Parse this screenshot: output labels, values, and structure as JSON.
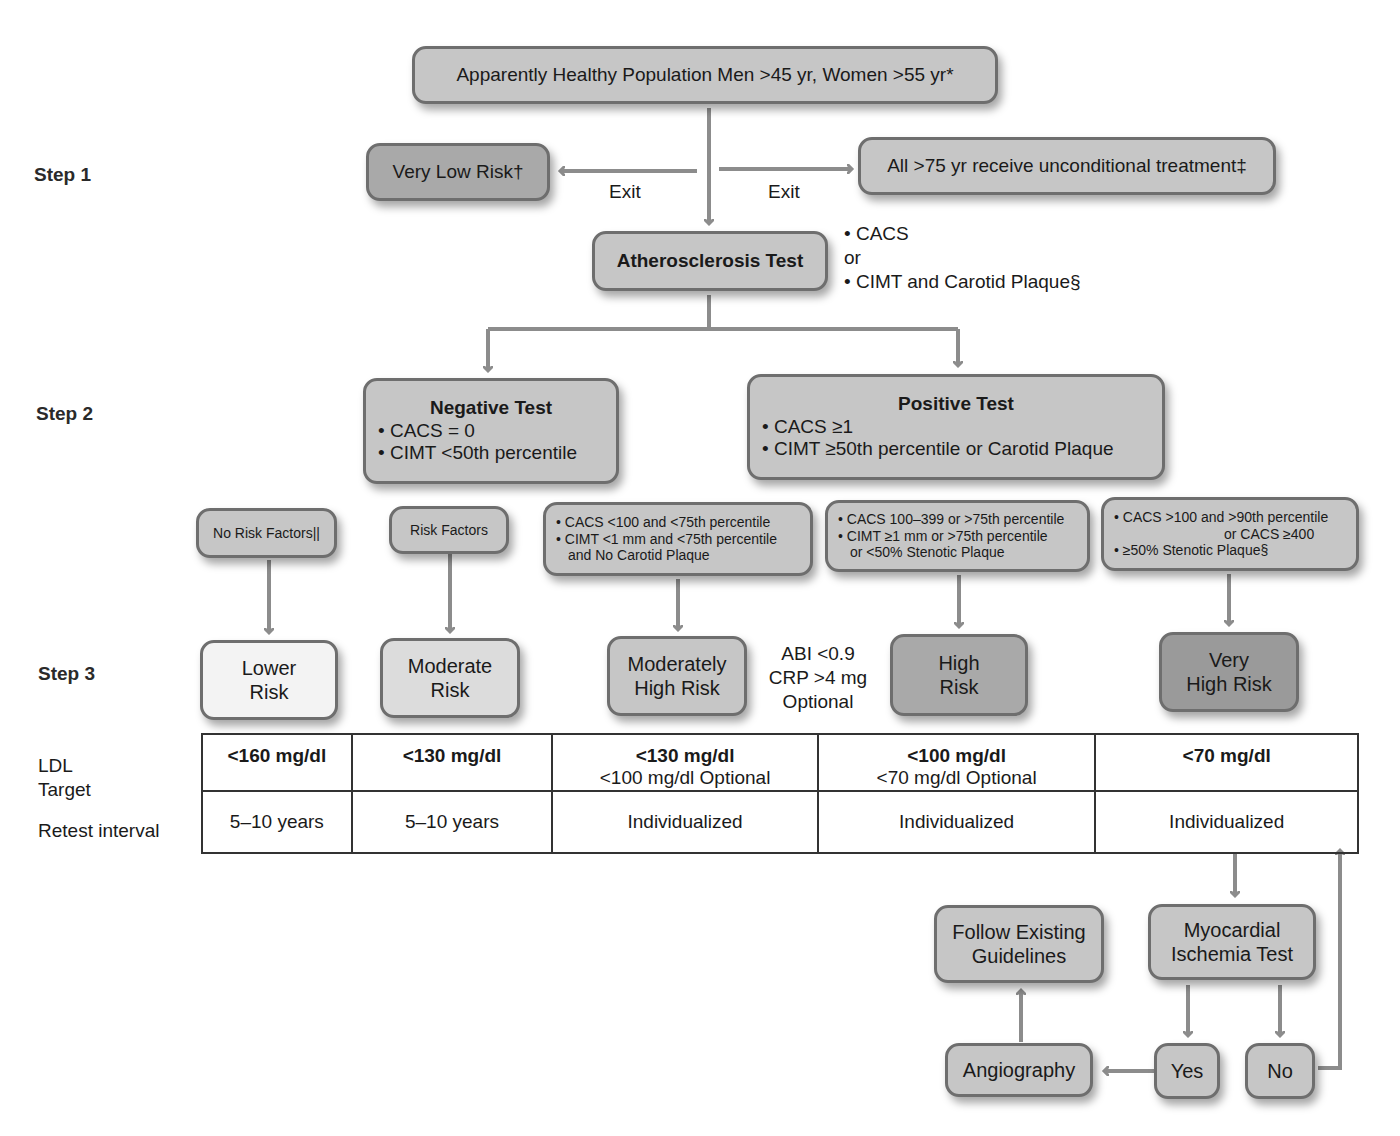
{
  "steps": {
    "step1": "Step 1",
    "step2": "Step 2",
    "step3": "Step 3"
  },
  "top_node": "Apparently Healthy Population Men >45 yr, Women >55 yr*",
  "exit_left": {
    "label": "Exit",
    "node": "Very Low Risk†"
  },
  "exit_right": {
    "label": "Exit",
    "node": "All >75 yr receive unconditional treatment‡"
  },
  "atherosclerosis_test": {
    "title": "Atherosclerosis Test",
    "options": [
      "• CACS",
      "or",
      "• CIMT and Carotid Plaque§"
    ]
  },
  "negative_test": {
    "title": "Negative Test",
    "bullets": [
      "• CACS = 0",
      "• CIMT <50th percentile"
    ]
  },
  "positive_test": {
    "title": "Positive Test",
    "bullets": [
      "• CACS ≥1",
      "• CIMT ≥50th percentile or Carotid Plaque"
    ]
  },
  "criteria": {
    "no_risk_factors": "No Risk Factors||",
    "risk_factors": "Risk Factors",
    "mod_high": [
      "• CACS <100 and <75th percentile",
      "• CIMT <1 mm and <75th percentile",
      "and No Carotid Plaque"
    ],
    "high": [
      "• CACS 100–399 or >75th percentile",
      "• CIMT ≥1 mm or >75th percentile",
      "or <50% Stenotic Plaque"
    ],
    "very_high": [
      "• CACS >100 and >90th percentile",
      "or CACS ≥400",
      "• ≥50% Stenotic Plaque§"
    ]
  },
  "risk_levels": {
    "lower": [
      "Lower",
      "Risk"
    ],
    "moderate": [
      "Moderate",
      "Risk"
    ],
    "moderately_high": [
      "Moderately",
      "High Risk"
    ],
    "high": [
      "High",
      "Risk"
    ],
    "very_high": [
      "Very",
      "High Risk"
    ]
  },
  "optional_note": [
    "ABI <0.9",
    "CRP >4 mg",
    "Optional"
  ],
  "table": {
    "row_labels": {
      "ldl": [
        "LDL",
        "Target"
      ],
      "retest": "Retest interval"
    },
    "ldl_targets": [
      {
        "main": "<160 mg/dl",
        "optional": ""
      },
      {
        "main": "<130 mg/dl",
        "optional": ""
      },
      {
        "main": "<130 mg/dl",
        "optional": "<100 mg/dl Optional"
      },
      {
        "main": "<100 mg/dl",
        "optional": "<70 mg/dl Optional"
      },
      {
        "main": "<70 mg/dl",
        "optional": ""
      }
    ],
    "retest_intervals": [
      "5–10 years",
      "5–10 years",
      "Individualized",
      "Individualized",
      "Individualized"
    ]
  },
  "followup": {
    "ischemia_test": [
      "Myocardial",
      "Ischemia Test"
    ],
    "follow_guidelines": [
      "Follow Existing",
      "Guidelines"
    ],
    "angiography": "Angiography",
    "yes": "Yes",
    "no": "No"
  },
  "colors": {
    "arrow": "#8c8c8c",
    "box_border": "#6e6e6e",
    "lower_risk_fill": "#f3f3f3",
    "moderate_risk_fill": "#dcdcdc",
    "default_fill": "#c6c6c6",
    "high_risk_fill": "#a9a9a9",
    "very_high_risk_fill": "#9a9a9a"
  }
}
